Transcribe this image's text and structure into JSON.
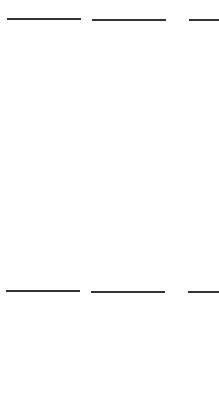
{
  "colors": {
    "circle": "#ef5b47",
    "grid_line": "#333333",
    "background": "#ffffff"
  },
  "question_label": {
    "open": "(",
    "number": "13",
    "close": ")"
  },
  "top_row": {
    "frames": [
      {
        "id": "frame-a",
        "rows": 5,
        "cols": 2,
        "filled": 10
      },
      {
        "id": "frame-b",
        "rows": 5,
        "cols": 2,
        "filled": 0
      },
      {
        "id": "frame-c",
        "rows": 5,
        "cols": 2,
        "filled": 5,
        "note": "only left column visible"
      }
    ]
  },
  "bottom_row": {
    "frames": [
      {
        "id": "frame-d",
        "rows": 5,
        "cols": 2,
        "filled": 10,
        "note": "partially visible"
      },
      {
        "id": "frame-e",
        "rows": 5,
        "cols": 2,
        "filled": 0
      },
      {
        "id": "frame-f",
        "rows": 5,
        "cols": 2,
        "filled": 5,
        "note": "only left column visible"
      }
    ]
  }
}
